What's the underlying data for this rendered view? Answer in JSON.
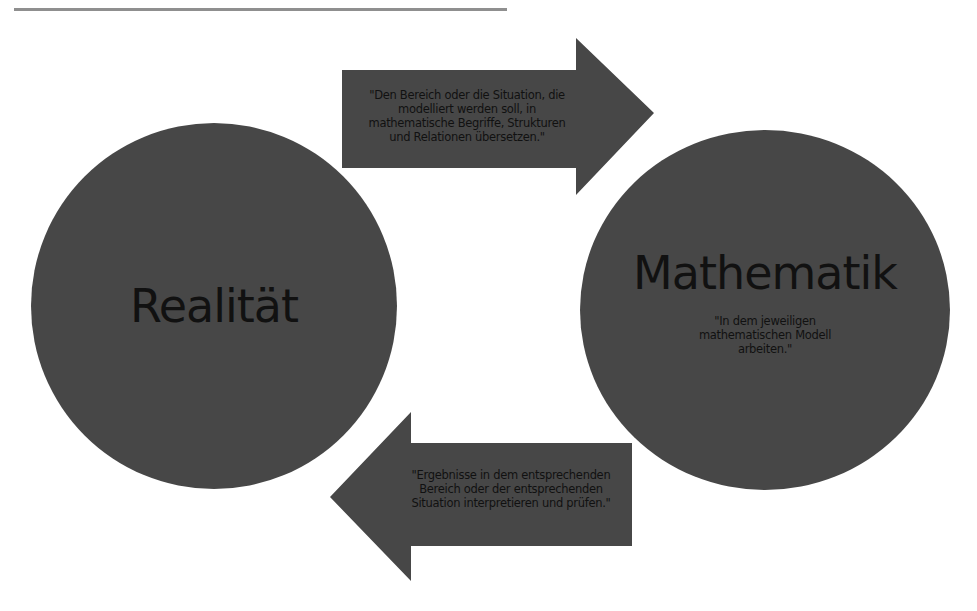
{
  "diagram": {
    "colors": {
      "shape_fill": "#474747",
      "text": "#111111",
      "rule": "#8f8f8f",
      "background": "#ffffff"
    },
    "nodes": [
      {
        "id": "realitaet",
        "title": "Realität"
      },
      {
        "id": "mathematik",
        "title": "Mathematik",
        "description": "\"In dem jeweiligen mathematischen Modell arbeiten.\"",
        "description_lines": [
          "\"In dem jeweiligen",
          "mathematischen Modell",
          "arbeiten.\""
        ]
      }
    ],
    "edges": [
      {
        "from": "realitaet",
        "to": "mathematik",
        "direction": "right",
        "text": "\"Den Bereich oder die Situation, die modelliert werden soll, in mathematische Begriffe, Strukturen und Relationen übersetzen.\"",
        "lines": [
          "\"Den Bereich oder die Situation, die",
          "modelliert werden soll, in",
          "mathematische Begriffe, Strukturen",
          "und Relationen übersetzen.\""
        ]
      },
      {
        "from": "mathematik",
        "to": "realitaet",
        "direction": "left",
        "text": "\"Ergebnisse in dem entsprechenden Bereich oder der entsprechenden Situation interpretieren und prüfen.\"",
        "lines": [
          "\"Ergebnisse in dem entsprechenden",
          "Bereich oder der entsprechenden",
          "Situation interpretieren und prüfen.\""
        ]
      }
    ]
  }
}
